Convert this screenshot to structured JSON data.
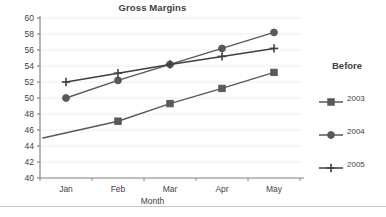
{
  "chart_data": {
    "type": "line",
    "title": "Gross Margins",
    "xlabel": "Month",
    "ylabel": "",
    "categories": [
      "Jan",
      "Feb",
      "Mar",
      "Apr",
      "May"
    ],
    "ylim": [
      40,
      60
    ],
    "ytick_step": 2,
    "yticks": [
      "60",
      "58",
      "56",
      "54",
      "52",
      "50",
      "48",
      "46",
      "44",
      "42",
      "40"
    ],
    "grid": true,
    "legend_position": "right",
    "legend_title": "Before",
    "series": [
      {
        "name": "2003",
        "marker": "square",
        "color": "#595959",
        "values": [
          null,
          47.1,
          49.3,
          51.2,
          53.2
        ],
        "line_start_value": 45.0
      },
      {
        "name": "2004",
        "marker": "circle",
        "color": "#595959",
        "values": [
          50.0,
          52.2,
          54.2,
          56.2,
          58.2
        ]
      },
      {
        "name": "2005",
        "marker": "plus",
        "color": "#3f3f3f",
        "values": [
          52.0,
          53.1,
          54.2,
          55.2,
          56.2
        ]
      }
    ]
  },
  "colors": {
    "axis": "#868686",
    "grid": "#eeeeee",
    "text": "#3f3f3f",
    "line": "#595959",
    "rule": "#c9c9c9",
    "background": "#ffffff"
  }
}
